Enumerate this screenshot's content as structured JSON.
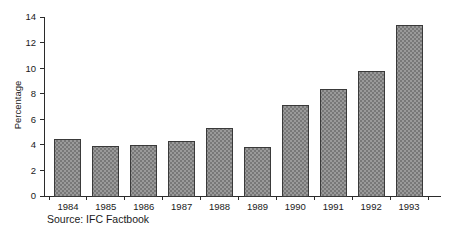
{
  "chart_data": {
    "type": "bar",
    "title": "",
    "subtitle": "",
    "xlabel": "",
    "ylabel": "Percentage",
    "categories": [
      "1984",
      "1985",
      "1986",
      "1987",
      "1988",
      "1989",
      "1990",
      "1991",
      "1992",
      "1993"
    ],
    "values": [
      4.4,
      3.85,
      3.95,
      4.25,
      5.25,
      3.8,
      7.1,
      8.3,
      9.75,
      13.35
    ],
    "ylim": [
      0,
      14
    ],
    "ytick_values": [
      0,
      2,
      4,
      6,
      8,
      10,
      12,
      14
    ],
    "ytick_labels": [
      "0",
      "2",
      "4",
      "6",
      "8",
      "10",
      "12",
      "14"
    ],
    "grid": false,
    "legend": false,
    "legend_position": "none",
    "annotations": [
      "Source: IFC Factbook"
    ],
    "bar_fill_color": "#8a8a8a",
    "bar_edge_color": "#3a3a3a",
    "bar_pattern": "checkerboard-hatch",
    "axis_color": "#2b2b2b",
    "background_color": "#ffffff"
  },
  "source_note": {
    "text": "Source: IFC Factbook"
  }
}
